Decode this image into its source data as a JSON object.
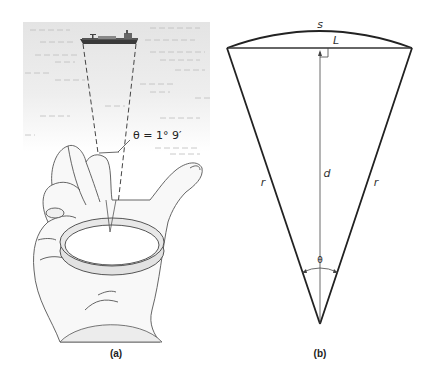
{
  "panel_a": {
    "caption": "(a)",
    "angle_label": "θ = 1° 9′",
    "scene": {
      "sea_color": "#e6e6e6",
      "ship_color": "#3a3a3a",
      "hand_fill": "#f7f7f7",
      "ring_fill": "#e2e2e2",
      "line_color": "#444444"
    }
  },
  "panel_b": {
    "caption": "(b)",
    "labels": {
      "arc": "s",
      "chord": "L",
      "height": "d",
      "radius_left": "r",
      "radius_right": "r",
      "apex_angle": "θ"
    },
    "line_color": "#222222"
  }
}
